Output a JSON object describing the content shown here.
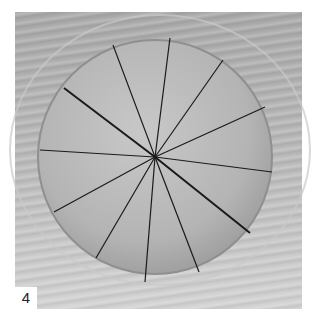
{
  "figure": {
    "label": "4",
    "colors": {
      "background": "#ffffff",
      "wood": "#b0b0b0",
      "disc": "#bdbdbd",
      "cut_line": "#1a1a1a"
    },
    "disc": {
      "cx": 155,
      "cy": 157,
      "r": 117
    },
    "cuts": [
      {
        "x": 113,
        "y": 45
      },
      {
        "x": 170,
        "y": 38
      },
      {
        "x": 223,
        "y": 60
      },
      {
        "x": 265,
        "y": 107
      },
      {
        "x": 272,
        "y": 172
      },
      {
        "x": 250,
        "y": 233
      },
      {
        "x": 199,
        "y": 272
      },
      {
        "x": 145,
        "y": 282
      },
      {
        "x": 96,
        "y": 258
      },
      {
        "x": 54,
        "y": 212
      },
      {
        "x": 40,
        "y": 150
      },
      {
        "x": 64,
        "y": 88
      }
    ]
  }
}
